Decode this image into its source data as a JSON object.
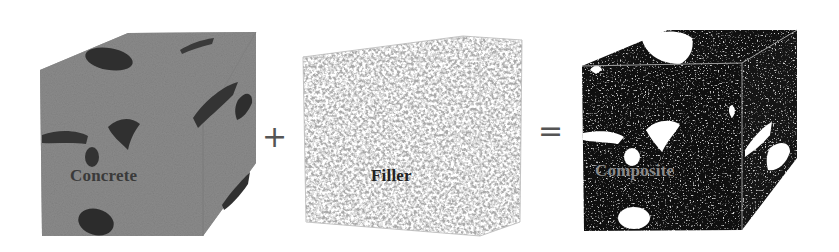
{
  "diagram": {
    "items": [
      {
        "label": "Concrete",
        "color": "#8c8c8c"
      },
      {
        "label": "Filler",
        "color": "#ffffff"
      },
      {
        "label": "Composite",
        "color": "#111111"
      }
    ],
    "operators": [
      "+",
      "="
    ],
    "label_colors": {
      "concrete": "#3a3a3a",
      "filler": "#222222",
      "composite": "#8a8a8a"
    }
  }
}
